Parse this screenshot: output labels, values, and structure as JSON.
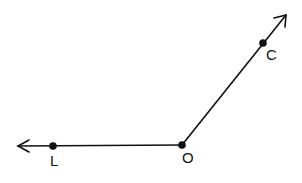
{
  "diagram": {
    "type": "angle",
    "vertex": {
      "label": "O",
      "x": 182,
      "y": 145
    },
    "points": [
      {
        "label": "L",
        "x": 53,
        "y": 146
      },
      {
        "label": "C",
        "x": 263,
        "y": 43
      }
    ],
    "rays": [
      {
        "name": "ray-OL",
        "from": "O",
        "through": "L"
      },
      {
        "name": "ray-OC",
        "from": "O",
        "through": "C"
      }
    ],
    "labels": {
      "L": "L",
      "O": "O",
      "C": "C"
    },
    "colors": {
      "line": "#111111",
      "background": "#ffffff"
    }
  }
}
